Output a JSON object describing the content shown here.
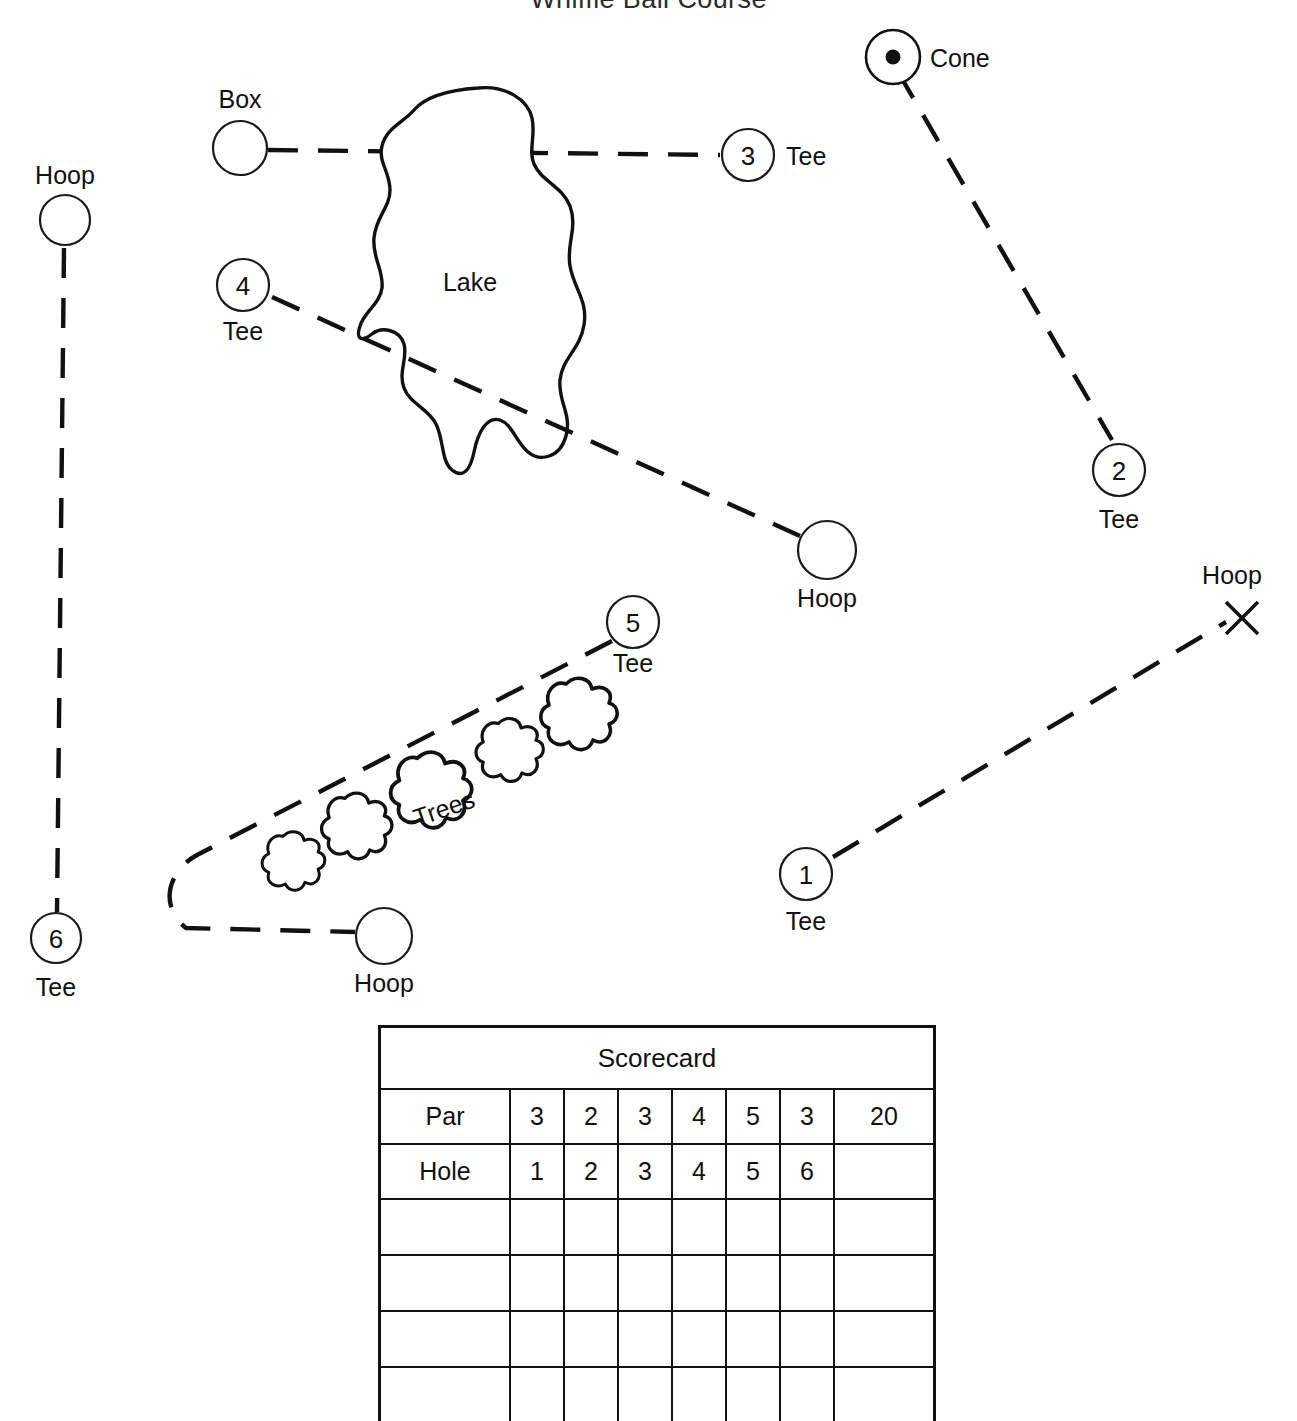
{
  "title": "Whiffle Ball Course",
  "map": {
    "lake_label": "Lake",
    "trees_label": "Trees",
    "box_label": "Box",
    "cone_label": "Cone",
    "tee_label": "Tee",
    "hoop_label": "Hoop",
    "holes": [
      {
        "number": "1",
        "tee_label": "Tee",
        "target": "Hoop",
        "target_marker": "x-mark"
      },
      {
        "number": "2",
        "tee_label": "Tee",
        "target": "Cone",
        "target_marker": "dot-circle"
      },
      {
        "number": "3",
        "tee_label": "Tee",
        "target": "Box",
        "target_marker": "circle"
      },
      {
        "number": "4",
        "tee_label": "Tee",
        "target": "Hoop",
        "target_marker": "circle"
      },
      {
        "number": "5",
        "tee_label": "Tee",
        "target": "Hoop",
        "target_marker": "circle"
      },
      {
        "number": "6",
        "tee_label": "Tee",
        "target": "Hoop",
        "target_marker": "circle"
      }
    ],
    "hoop_labels": {
      "left": "Hoop",
      "middle": "Hoop",
      "right": "Hoop",
      "bottom": "Hoop"
    },
    "tee_labels": {
      "t1": "Tee",
      "t2": "Tee",
      "t3": "Tee",
      "t4": "Tee",
      "t5": "Tee",
      "t6": "Tee"
    },
    "numbers": {
      "n1": "1",
      "n2": "2",
      "n3": "3",
      "n4": "4",
      "n5": "5",
      "n6": "6"
    },
    "tree_count": 5,
    "colors": {
      "ink": "#111111",
      "paper": "#ffffff"
    }
  },
  "scorecard": {
    "title": "Scorecard",
    "rows": [
      {
        "label": "Par",
        "cells": [
          "3",
          "2",
          "3",
          "4",
          "5",
          "3"
        ],
        "total": "20"
      },
      {
        "label": "Hole",
        "cells": [
          "1",
          "2",
          "3",
          "4",
          "5",
          "6"
        ],
        "total": ""
      }
    ],
    "blank_rows": 4,
    "columns": 8
  }
}
